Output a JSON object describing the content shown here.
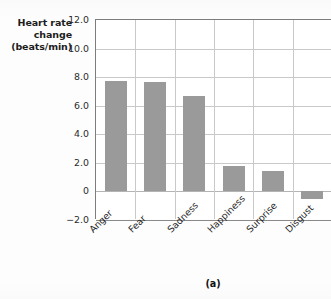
{
  "figure": {
    "caption": "(a)",
    "bar_color": "#9a9a9a",
    "grid_color": "#c9c9c9",
    "axis_color": "#7d7d7d"
  },
  "axis_title": {
    "line1": "Heart rate",
    "line2": "change",
    "line3": "(beats/min)"
  },
  "chart_data": {
    "type": "bar",
    "title": "",
    "subtitle": "",
    "xlabel": "",
    "ylabel": "Heart rate change (beats/min)",
    "categories": [
      "Anger",
      "Fear",
      "Sadness",
      "Happiness",
      "Surprise",
      "Disgust"
    ],
    "values": [
      7.7,
      7.65,
      6.65,
      1.8,
      1.4,
      -0.5
    ],
    "series": [
      {
        "name": "Heart rate change",
        "values": [
          7.7,
          7.65,
          6.65,
          1.8,
          1.4,
          -0.5
        ]
      }
    ],
    "ylim": [
      -2.0,
      12.0
    ],
    "yticks": [
      12.0,
      10.0,
      8.0,
      6.0,
      4.0,
      2.0,
      0,
      -2.0
    ],
    "ytick_labels": [
      "12.0",
      "10.0",
      "8.0",
      "6.0",
      "4.0",
      "2.0",
      "0",
      "−2.0"
    ],
    "grid": "horizontal-and-vertical",
    "legend": "none",
    "legend_position": "none",
    "annotations": [
      "(a)"
    ],
    "xtick_rotation": -45
  }
}
